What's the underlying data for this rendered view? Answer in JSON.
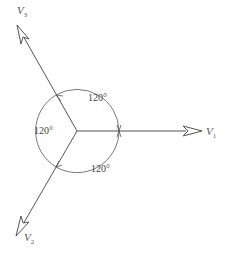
{
  "diagram": {
    "type": "phasor-diagram",
    "phasors": [
      {
        "name": "V",
        "subscript": "1",
        "angle_deg": 0
      },
      {
        "name": "V",
        "subscript": "2",
        "angle_deg": -120
      },
      {
        "name": "V",
        "subscript": "3",
        "angle_deg": 120
      }
    ],
    "angles": [
      {
        "label": "120°",
        "between": "V1-V3"
      },
      {
        "label": "120°",
        "between": "V3-V2"
      },
      {
        "label": "120°",
        "between": "V2-V1"
      }
    ],
    "colors": {
      "line": "#555555",
      "text": "#555555"
    }
  }
}
